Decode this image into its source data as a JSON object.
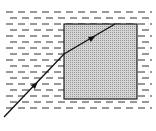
{
  "diagram": {
    "title": "",
    "liquid": {
      "pattern": "dashed-lines",
      "x": [
        6,
        152
      ],
      "y_start": 12,
      "y_end": 112,
      "row_spacing": 6,
      "color": "#333333"
    },
    "block": {
      "x": 64,
      "y": 24,
      "width": 73,
      "height": 75,
      "fill": "#c8c8c8",
      "stroke": "#222222"
    },
    "ray": {
      "points": [
        [
          4,
          117
        ],
        [
          64,
          54
        ],
        [
          115,
          24
        ]
      ],
      "color": "#111111",
      "arrows": [
        {
          "x": 35,
          "y": 85,
          "label": "incident-direction"
        },
        {
          "x": 92,
          "y": 38,
          "label": "refracted-direction"
        }
      ]
    },
    "caption": ""
  }
}
